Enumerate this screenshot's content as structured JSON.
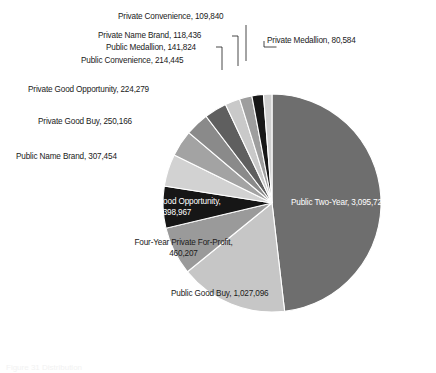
{
  "figure": {
    "caption": "Figure 31  Distribution",
    "background": "#ffffff"
  },
  "chart_data": {
    "type": "pie",
    "title": "",
    "xlabel": "",
    "ylabel": "",
    "legend": "none",
    "grid": false,
    "total": 6429018,
    "start_angle_deg": 0,
    "direction": "clockwise",
    "categories": [
      "Public Two-Year",
      "Public Good Buy",
      "Four-Year Private For-Profit",
      "Public Good Opportunity",
      "Public Name Brand",
      "Private Good Buy",
      "Private Good Opportunity",
      "Public Convenience",
      "Public Medallion",
      "Private Name Brand",
      "Private Convenience",
      "Private Medallion"
    ],
    "values": [
      3095720,
      1027096,
      460207,
      398967,
      307454,
      250166,
      224279,
      214445,
      141824,
      118436,
      109840,
      80584
    ],
    "value_labels": [
      "3,095,720",
      "1,027,096",
      "460,207",
      "398,967",
      "307,454",
      "250,166",
      "224,279",
      "214,445",
      "141,824",
      "118,436",
      "109,840",
      "80,584"
    ],
    "colors": [
      "#6e6e6e",
      "#c6c6c6",
      "#9a9a9a",
      "#161616",
      "#d2d2d2",
      "#a3a3a3",
      "#8a8a8a",
      "#5f5f5f",
      "#c9c9c9",
      "#9e9e9e",
      "#171717",
      "#cfcfcf"
    ],
    "slices": [
      {
        "name": "Public Two-Year",
        "value": 3095720,
        "value_label": "3,095,720",
        "label": "Public Two-Year, 3,095,720",
        "color": "#6e6e6e",
        "label_placement": "inside",
        "label_color": "#ffffff"
      },
      {
        "name": "Public Good Buy",
        "value": 1027096,
        "value_label": "1,027,096",
        "label": "Public Good Buy, 1,027,096",
        "color": "#c6c6c6",
        "label_placement": "inside",
        "label_color": "#1a1a1a"
      },
      {
        "name": "Four-Year Private For-Profit",
        "value": 460207,
        "value_label": "460,207",
        "label_line1": "Four-Year Private For-Profit,",
        "label_line2": "460,207",
        "color": "#9a9a9a",
        "label_placement": "inside",
        "label_color": "#1a1a1a"
      },
      {
        "name": "Public Good Opportunity",
        "value": 398967,
        "value_label": "398,967",
        "label_line1": "Public Good Opportunity,",
        "label_line2": "398,967",
        "color": "#161616",
        "label_placement": "inside",
        "label_color": "#ffffff"
      },
      {
        "name": "Public Name Brand",
        "value": 307454,
        "value_label": "307,454",
        "label": "Public Name Brand, 307,454",
        "color": "#d2d2d2",
        "label_placement": "outside",
        "label_color": "#1a1a1a"
      },
      {
        "name": "Private Good Buy",
        "value": 250166,
        "value_label": "250,166",
        "label": "Private Good Buy, 250,166",
        "color": "#a3a3a3",
        "label_placement": "outside",
        "label_color": "#1a1a1a"
      },
      {
        "name": "Private Good Opportunity",
        "value": 224279,
        "value_label": "224,279",
        "label": "Private Good Opportunity, 224,279",
        "color": "#8a8a8a",
        "label_placement": "outside",
        "label_color": "#1a1a1a"
      },
      {
        "name": "Public Convenience",
        "value": 214445,
        "value_label": "214,445",
        "label": "Public Convenience, 214,445",
        "color": "#5f5f5f",
        "label_placement": "outside",
        "label_color": "#1a1a1a"
      },
      {
        "name": "Public Medallion",
        "value": 141824,
        "value_label": "141,824",
        "label": "Public Medallion, 141,824",
        "color": "#c9c9c9",
        "label_placement": "outside-leader",
        "label_color": "#1a1a1a"
      },
      {
        "name": "Private Name Brand",
        "value": 118436,
        "value_label": "118,436",
        "label": "Private Name Brand, 118,436",
        "color": "#9e9e9e",
        "label_placement": "outside-leader",
        "label_color": "#1a1a1a"
      },
      {
        "name": "Private Convenience",
        "value": 109840,
        "value_label": "109,840",
        "label": "Private Convenience, 109,840",
        "color": "#171717",
        "label_placement": "outside-leader",
        "label_color": "#1a1a1a"
      },
      {
        "name": "Private Medallion",
        "value": 80584,
        "value_label": "80,584",
        "label": "Private Medallion, 80,584",
        "color": "#cfcfcf",
        "label_placement": "outside-leader",
        "label_color": "#1a1a1a"
      }
    ]
  },
  "labels": {
    "private_convenience": "Private Convenience, 109,840",
    "private_name_brand": "Private Name Brand, 118,436",
    "public_medallion": "Public Medallion, 141,824",
    "public_convenience": "Public Convenience, 214,445",
    "private_good_opportunity": "Private Good Opportunity, 224,279",
    "private_good_buy": "Private Good Buy, 250,166",
    "public_name_brand": "Public Name Brand, 307,454",
    "private_medallion": "Private Medallion, 80,584",
    "public_two_year": "Public Two-Year, 3,095,720",
    "public_good_opportunity_l1": "Public Good Opportunity,",
    "public_good_opportunity_l2": "398,967",
    "four_year_private_l1": "Four-Year Private For-Profit,",
    "four_year_private_l2": "460,207",
    "public_good_buy": "Public Good Buy, 1,027,096"
  }
}
